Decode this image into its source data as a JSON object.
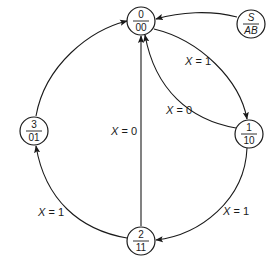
{
  "diagram": {
    "type": "state-diagram",
    "legend_node": {
      "top": "S",
      "bottom": "AB"
    },
    "nodes": [
      {
        "id": "s0",
        "state": "0",
        "output": "00"
      },
      {
        "id": "s1",
        "state": "1",
        "output": "10"
      },
      {
        "id": "s2",
        "state": "2",
        "output": "11"
      },
      {
        "id": "s3",
        "state": "3",
        "output": "01"
      }
    ],
    "edges": [
      {
        "from": "legend",
        "to": "s0",
        "label": ""
      },
      {
        "from": "s0",
        "to": "s1",
        "label": "X = 1"
      },
      {
        "from": "s1",
        "to": "s0",
        "label": "X = 0"
      },
      {
        "from": "s1",
        "to": "s2",
        "label": "X = 1"
      },
      {
        "from": "s2",
        "to": "s0",
        "label": "X = 0"
      },
      {
        "from": "s2",
        "to": "s3",
        "label": "X = 1"
      },
      {
        "from": "s3",
        "to": "s0",
        "label": ""
      }
    ],
    "label_var": "X",
    "label_eq": " = ",
    "edge_values": {
      "e01": "1",
      "e10": "0",
      "e12": "1",
      "e20": "0",
      "e23": "1"
    }
  },
  "colors": {
    "ink": "#1a1a1a",
    "background": "#ffffff"
  }
}
